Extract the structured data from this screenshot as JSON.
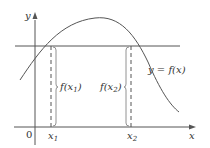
{
  "diagram": {
    "axis_x_label": "x",
    "axis_y_label": "y",
    "origin_label": "0",
    "curve_label": "y = f(x)",
    "x1_label": "x",
    "x1_sub": "1",
    "x2_label": "x",
    "x2_sub": "2",
    "fx1_pre": "f(x",
    "fx1_sub": "1",
    "fx1_post": ")",
    "fx2_pre": "f(x",
    "fx2_sub": "2",
    "fx2_post": ")",
    "colors": {
      "line": "#555555",
      "text": "#333333"
    }
  }
}
